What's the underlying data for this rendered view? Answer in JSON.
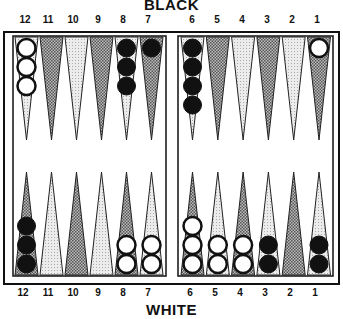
{
  "labels": {
    "top": "BLACK",
    "bottom": "WHITE"
  },
  "point_numbers": {
    "left": [
      "12",
      "11",
      "10",
      "9",
      "8",
      "7"
    ],
    "right": [
      "6",
      "5",
      "4",
      "3",
      "2",
      "1"
    ]
  },
  "colors": {
    "frame": "#111111",
    "dark_point": "#8a8a8a",
    "light_point": "#d9d9d9",
    "black_checker": "#111111",
    "white_checker": "#ffffff"
  },
  "position": {
    "top": [
      {
        "point": "12",
        "color": "white",
        "count": 3
      },
      {
        "point": "11",
        "color": null,
        "count": 0
      },
      {
        "point": "10",
        "color": null,
        "count": 0
      },
      {
        "point": "9",
        "color": null,
        "count": 0
      },
      {
        "point": "8",
        "color": "black",
        "count": 3
      },
      {
        "point": "7",
        "color": "black",
        "count": 1
      },
      {
        "point": "6",
        "color": "black",
        "count": 4
      },
      {
        "point": "5",
        "color": null,
        "count": 0
      },
      {
        "point": "4",
        "color": null,
        "count": 0
      },
      {
        "point": "3",
        "color": null,
        "count": 0
      },
      {
        "point": "2",
        "color": null,
        "count": 0
      },
      {
        "point": "1",
        "color": "white",
        "count": 1
      }
    ],
    "bottom": [
      {
        "point": "12",
        "color": "black",
        "count": 3
      },
      {
        "point": "11",
        "color": null,
        "count": 0
      },
      {
        "point": "10",
        "color": null,
        "count": 0
      },
      {
        "point": "9",
        "color": null,
        "count": 0
      },
      {
        "point": "8",
        "color": "white",
        "count": 2
      },
      {
        "point": "7",
        "color": "white",
        "count": 2
      },
      {
        "point": "6",
        "color": "white",
        "count": 3
      },
      {
        "point": "5",
        "color": "white",
        "count": 2
      },
      {
        "point": "4",
        "color": "white",
        "count": 2
      },
      {
        "point": "3",
        "color": "black",
        "count": 2
      },
      {
        "point": "2",
        "color": null,
        "count": 0
      },
      {
        "point": "1",
        "color": "black",
        "count": 2
      }
    ]
  }
}
